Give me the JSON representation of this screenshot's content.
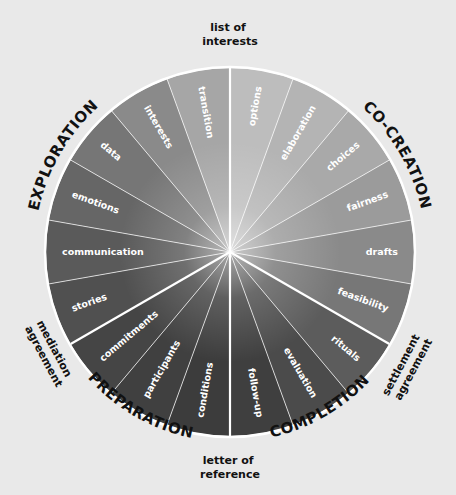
{
  "diagram": {
    "type": "wheel",
    "center": [
      230,
      252
    ],
    "radius": 184,
    "segment_sweep_deg": 20,
    "background_color": "#e9e9e9",
    "divider_color": "#ffffff",
    "segments": [
      {
        "label": "options",
        "phase": "CO-CREATION",
        "color": "#bdbdbd"
      },
      {
        "label": "elaboration",
        "phase": "CO-CREATION",
        "color": "#b4b4b4"
      },
      {
        "label": "choices",
        "phase": "CO-CREATION",
        "color": "#a9a9a9"
      },
      {
        "label": "fairness",
        "phase": "CO-CREATION",
        "color": "#9b9b9b"
      },
      {
        "label": "drafts",
        "phase": "CO-CREATION",
        "color": "#8a8a8a"
      },
      {
        "label": "feasibility",
        "phase": "CO-CREATION",
        "color": "#777777"
      },
      {
        "label": "rituals",
        "phase": "COMPLETION",
        "color": "#5c5c5c"
      },
      {
        "label": "evaluation",
        "phase": "COMPLETION",
        "color": "#4b4b4b"
      },
      {
        "label": "follow-up",
        "phase": "COMPLETION",
        "color": "#3f3f3f"
      },
      {
        "label": "conditions",
        "phase": "PREPARATION",
        "color": "#3c3c3c"
      },
      {
        "label": "participants",
        "phase": "PREPARATION",
        "color": "#404040"
      },
      {
        "label": "commitments",
        "phase": "PREPARATION",
        "color": "#454545"
      },
      {
        "label": "stories",
        "phase": "EXPLORATION",
        "color": "#505050"
      },
      {
        "label": "communication",
        "phase": "EXPLORATION",
        "color": "#5a5a5a"
      },
      {
        "label": "emotions",
        "phase": "EXPLORATION",
        "color": "#666666"
      },
      {
        "label": "data",
        "phase": "EXPLORATION",
        "color": "#767676"
      },
      {
        "label": "interests",
        "phase": "EXPLORATION",
        "color": "#8a8a8a"
      },
      {
        "label": "transition",
        "phase": "EXPLORATION",
        "color": "#a6a6a6"
      }
    ],
    "major_dividers_deg": [
      0,
      120,
      180,
      240
    ],
    "phases": [
      {
        "label": "EXPLORATION",
        "center_deg": 300
      },
      {
        "label": "CO-CREATION",
        "center_deg": 60
      },
      {
        "label": "COMPLETION",
        "center_deg": 150
      },
      {
        "label": "PREPARATION",
        "center_deg": 210
      }
    ],
    "milestones": [
      {
        "id": "list-of-interests",
        "lines": [
          "list of",
          "interests"
        ]
      },
      {
        "id": "settlement-agreement",
        "lines": [
          "settlement",
          "agreement"
        ]
      },
      {
        "id": "letter-of-reference",
        "lines": [
          "letter of",
          "reference"
        ]
      },
      {
        "id": "mediation-agreement",
        "lines": [
          "mediation",
          "agreement"
        ]
      }
    ]
  }
}
